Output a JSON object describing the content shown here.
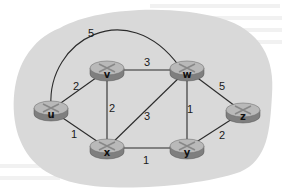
{
  "diagram": {
    "title": "",
    "type": "network-graph",
    "colors": {
      "cloud": "#d9d9d9",
      "router_top": "#b9b9b9",
      "router_side": "#7f7f7f",
      "edge": "#2b2b2b",
      "background": "#ffffff"
    },
    "nodes": [
      {
        "id": "u",
        "label": "u",
        "x": 51,
        "y": 110
      },
      {
        "id": "v",
        "label": "v",
        "x": 107,
        "y": 70
      },
      {
        "id": "w",
        "label": "w",
        "x": 187,
        "y": 70
      },
      {
        "id": "x",
        "label": "x",
        "x": 107,
        "y": 148
      },
      {
        "id": "y",
        "label": "y",
        "x": 187,
        "y": 148
      },
      {
        "id": "z",
        "label": "z",
        "x": 243,
        "y": 112
      }
    ],
    "edges": [
      {
        "from": "u",
        "to": "w",
        "cost": "5",
        "curved": true,
        "label_x": 91,
        "label_y": 37
      },
      {
        "from": "u",
        "to": "v",
        "cost": "2",
        "label_x": 76,
        "label_y": 90
      },
      {
        "from": "v",
        "to": "w",
        "cost": "3",
        "label_x": 147,
        "label_y": 66
      },
      {
        "from": "w",
        "to": "z",
        "cost": "5",
        "label_x": 222,
        "label_y": 90
      },
      {
        "from": "v",
        "to": "x",
        "cost": "2",
        "label_x": 112,
        "label_y": 112
      },
      {
        "from": "x",
        "to": "w",
        "cost": "3",
        "label_x": 147,
        "label_y": 120
      },
      {
        "from": "w",
        "to": "y",
        "cost": "1",
        "label_x": 190,
        "label_y": 113
      },
      {
        "from": "u",
        "to": "x",
        "cost": "1",
        "label_x": 74,
        "label_y": 138
      },
      {
        "from": "x",
        "to": "y",
        "cost": "1",
        "label_x": 146,
        "label_y": 164
      },
      {
        "from": "y",
        "to": "z",
        "cost": "2",
        "label_x": 222,
        "label_y": 139
      }
    ]
  }
}
